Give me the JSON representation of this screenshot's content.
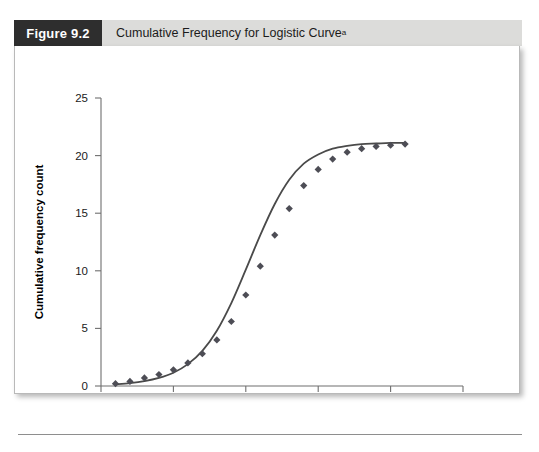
{
  "figure": {
    "number_label": "Figure 9.2",
    "caption": "Cumulative Frequency for Logistic Curve",
    "caption_superscript": "a"
  },
  "colors": {
    "header_band": "#dcdcda",
    "number_box": "#2e2e2e",
    "panel_background": "#ffffff",
    "axis": "#6f6f6f",
    "curve": "#4a4a4a",
    "marker": "#4d4d55"
  },
  "chart_data": {
    "type": "scatter",
    "title": "Cumulative Frequency for Logistic Curve",
    "xlabel": "Time period",
    "ylabel": "Cumulative frequency count",
    "xlim": [
      0,
      25
    ],
    "ylim": [
      0,
      25
    ],
    "xticks": [
      0,
      5,
      10,
      15,
      20,
      25
    ],
    "yticks": [
      0,
      5,
      10,
      15,
      20,
      25
    ],
    "grid": false,
    "legend": "none",
    "series": [
      {
        "name": "Observed cumulative frequency",
        "marker": "diamond",
        "x": [
          1,
          2,
          3,
          4,
          5,
          6,
          7,
          8,
          9,
          10,
          11,
          12,
          13,
          14,
          15,
          16,
          17,
          18,
          19,
          20,
          21
        ],
        "values": [
          0.2,
          0.4,
          0.7,
          1.0,
          1.4,
          2.0,
          2.8,
          4.0,
          5.6,
          7.9,
          10.4,
          13.1,
          15.4,
          17.4,
          18.8,
          19.7,
          20.3,
          20.6,
          20.8,
          20.9,
          21.0
        ]
      },
      {
        "name": "Fitted logistic curve",
        "marker": "none",
        "line": true,
        "x": [
          1,
          2,
          3,
          4,
          5,
          6,
          7,
          8,
          9,
          10,
          11,
          12,
          13,
          14,
          15,
          16,
          17,
          18,
          19,
          20,
          21
        ],
        "values": [
          0.15,
          0.25,
          0.42,
          0.7,
          1.15,
          1.9,
          3.05,
          4.8,
          7.2,
          10.1,
          13.1,
          15.8,
          17.9,
          19.3,
          20.1,
          20.6,
          20.85,
          21.0,
          21.05,
          21.1,
          21.1
        ]
      }
    ]
  }
}
